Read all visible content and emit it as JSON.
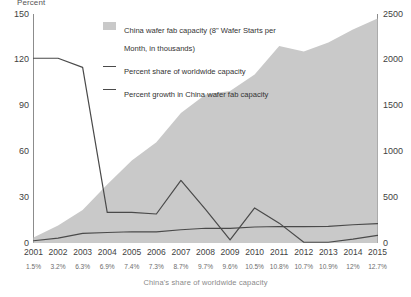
{
  "axis_title_left": "Percent",
  "caption": "China's share of worldwide capacity",
  "legend": [
    {
      "type": "area",
      "label": "China wafer fab capacity (8\" Wafer Starts per Month, in thousands)"
    },
    {
      "type": "line",
      "label": "Percent share of worldwide capacity"
    },
    {
      "type": "line",
      "label": "Percent growth in China wafer fab capacity"
    }
  ],
  "colors": {
    "area_fill": "#c9c9c9",
    "line": "#4a4a4a",
    "axis": "#8c8c8c",
    "tick_text": "#3f3f3f",
    "caption_text": "#8a8a8a"
  },
  "chart_data": {
    "type": "area",
    "title": "",
    "xlabel": "",
    "ylabel": "Percent",
    "y2label": "",
    "grid": false,
    "legend_position": "top-center",
    "categories": [
      2001,
      2002,
      2003,
      2004,
      2005,
      2006,
      2007,
      2008,
      2009,
      2010,
      2011,
      2012,
      2013,
      2014,
      2015
    ],
    "ylim": [
      0,
      150
    ],
    "yticks": [
      0,
      30,
      60,
      90,
      120,
      150
    ],
    "y2lim": [
      0,
      2500
    ],
    "y2ticks": [
      0,
      500,
      1000,
      1500,
      2000,
      2500
    ],
    "share_labels": [
      "1.5%",
      "3.2%",
      "6.3%",
      "6.9%",
      "7.4%",
      "7.3%",
      "8.7%",
      "9.7%",
      "9.6%",
      "10.5%",
      "10.8%",
      "10.7%",
      "10.9%",
      "12%",
      "12.7%"
    ],
    "series": [
      {
        "name": "China wafer fab capacity (8\" Wafer Starts per Month, in thousands)",
        "axis": "right",
        "kind": "area",
        "values": [
          60,
          190,
          360,
          640,
          900,
          1100,
          1420,
          1620,
          1660,
          1840,
          2150,
          2090,
          2190,
          2330,
          2450
        ]
      },
      {
        "name": "Percent share of worldwide capacity",
        "axis": "left",
        "kind": "line",
        "values": [
          1.5,
          3.2,
          6.3,
          6.9,
          7.4,
          7.3,
          8.7,
          9.7,
          9.6,
          10.5,
          10.8,
          10.7,
          10.9,
          12,
          12.7
        ]
      },
      {
        "name": "Percent growth in China wafer fab capacity",
        "axis": "left",
        "kind": "line",
        "values": [
          121,
          121,
          115,
          20,
          20,
          19,
          41,
          22,
          2,
          23,
          13,
          0.5,
          0.5,
          2.5,
          5
        ]
      }
    ]
  }
}
